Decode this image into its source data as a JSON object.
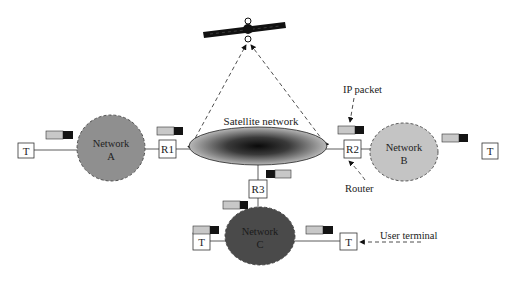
{
  "diagram": {
    "type": "network-topology",
    "satellite": {
      "label": "",
      "icon": "satellite-icon",
      "x": 248,
      "y": 30
    },
    "satellite_network": {
      "label": "Satellite network",
      "cx": 258,
      "cy": 146,
      "rx": 69,
      "ry": 19
    },
    "networks": [
      {
        "id": "A",
        "label_line1": "Network",
        "label_line2": "A",
        "cx": 111,
        "cy": 148,
        "rx": 34,
        "ry": 33,
        "fill": "#8f8f8f"
      },
      {
        "id": "B",
        "label_line1": "Network",
        "label_line2": "B",
        "cx": 404,
        "cy": 152,
        "rx": 34,
        "ry": 29,
        "fill": "#c4c4c4"
      },
      {
        "id": "C",
        "label_line1": "Network",
        "label_line2": "C",
        "cx": 260,
        "cy": 236,
        "rx": 35,
        "ry": 29,
        "fill": "#4a4a4a"
      }
    ],
    "routers": [
      {
        "label": "R1",
        "x": 159,
        "y": 140
      },
      {
        "label": "R2",
        "x": 344,
        "y": 140
      },
      {
        "label": "R3",
        "x": 249,
        "y": 180
      }
    ],
    "terminals": [
      {
        "label": "T",
        "x": 18,
        "y": 143
      },
      {
        "label": "T",
        "x": 482,
        "y": 143
      },
      {
        "label": "T",
        "x": 193,
        "y": 233
      },
      {
        "label": "T",
        "x": 340,
        "y": 233
      }
    ],
    "annotations": {
      "ip_packet": "IP packet",
      "router": "Router",
      "user_terminal": "User terminal"
    },
    "colors": {
      "packet_light": "#c8c8c8",
      "packet_dark": "#141414",
      "outline": "#333333"
    }
  }
}
